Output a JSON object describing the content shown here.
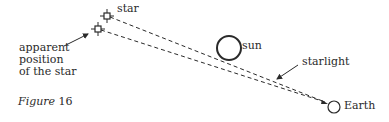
{
  "figure": {
    "caption_prefix": "Figure",
    "caption_number": "16"
  },
  "labels": {
    "star": "star",
    "apparent_line1": "apparent",
    "apparent_line2": "position",
    "apparent_line3": "of the star",
    "sun": "sun",
    "starlight": "starlight",
    "earth": "Earth"
  },
  "colors": {
    "ink": "#2a2a2a",
    "background": "#ffffff"
  }
}
